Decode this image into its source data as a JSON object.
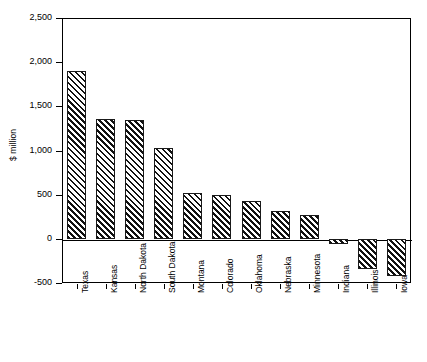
{
  "chart_data": {
    "type": "bar",
    "title": "",
    "subtitle": "",
    "xlabel": "",
    "ylabel": "$ million",
    "categories": [
      "Texas",
      "Kansas",
      "North Dakota",
      "South Dakota",
      "Montana",
      "Colorado",
      "Oklahoma",
      "Nebraska",
      "Minnesota",
      "Indiana",
      "Illinois",
      "Iowa"
    ],
    "values": [
      1900,
      1360,
      1350,
      1030,
      515,
      500,
      425,
      320,
      270,
      -60,
      -340,
      -420
    ],
    "ylim": [
      -500,
      2500
    ],
    "ytick_values": [
      2500,
      2000,
      1500,
      1000,
      500,
      0,
      -500
    ],
    "ytick_labels": [
      "2,500",
      "2,000",
      "1,500",
      "1,000",
      "500",
      "0",
      "-500"
    ],
    "grid": false,
    "legend": false,
    "legend_position": "none",
    "bar_fill": "diagonal-hatch",
    "bar_edge_color": "#000000",
    "plot_background": "#ffffff",
    "axis_color": "#000000",
    "zero_line": 0
  }
}
